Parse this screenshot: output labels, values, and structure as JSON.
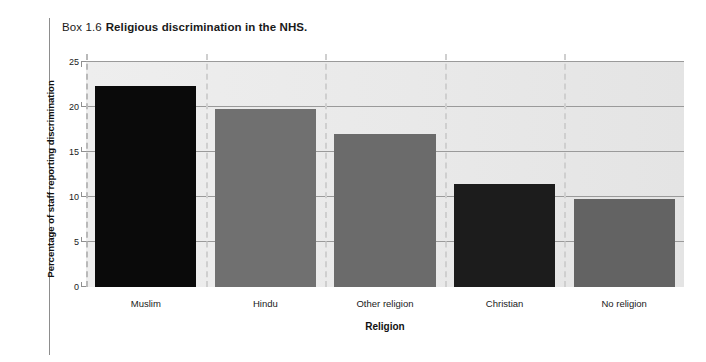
{
  "caption": {
    "box_number": "Box 1.6",
    "title": "Religious discrimination in the NHS."
  },
  "chart_data": {
    "type": "bar",
    "title": "Religious discrimination in the NHS.",
    "xlabel": "Religion",
    "ylabel": "Percentage of staff reporting discrimination",
    "categories": [
      "Muslim",
      "Hindu",
      "Other religion",
      "Christian",
      "No religion"
    ],
    "values": [
      22.3,
      19.8,
      17.0,
      11.4,
      9.8
    ],
    "bar_colors": [
      "#0a0a0a",
      "#707070",
      "#6b6b6b",
      "#1c1c1c",
      "#636363"
    ],
    "ylim": [
      0,
      25
    ],
    "yticks": [
      0,
      5,
      10,
      15,
      20,
      25
    ],
    "ytick_labels": [
      "0",
      "5",
      "10",
      "15",
      "20",
      "25"
    ],
    "grid": "horizontal-solid-and-vertical-dashed",
    "legend": "none",
    "plot_background": "#ececec"
  }
}
